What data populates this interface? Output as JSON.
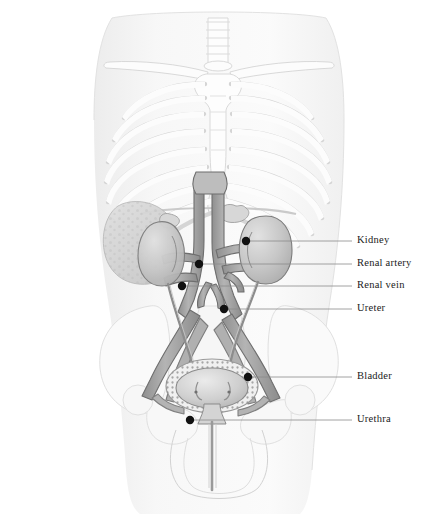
{
  "figure": {
    "style": "grayscale medical line drawing on white background",
    "view": "anterior (front) view of human torso"
  },
  "colors": {
    "background": "#ffffff",
    "body_silhouette": "#f2f2f2",
    "bone": "#fbfbfb",
    "bone_outline": "#d8d8d8",
    "vessel_fill": "#a8a8a8",
    "vessel_outline": "#6e6e6e",
    "kidney_fill": "#c9c9c9",
    "kidney_outline": "#7a7a7a",
    "bladder_fill": "#d2d2d2",
    "organ_shadow": "#bdbdbd",
    "leader_line": "#8a8a8a",
    "marker_dot": "#111111",
    "label_text": "#1a1a1a"
  },
  "labels": [
    {
      "id": "kidney",
      "text": "Kidney",
      "text_x": 357,
      "text_y": 243,
      "line_x1": 250,
      "line_y1": 241,
      "line_x2": 352,
      "line_y2": 241,
      "dot_x": 246,
      "dot_y": 241
    },
    {
      "id": "renal-artery",
      "text": "Renal artery",
      "text_x": 357,
      "text_y": 266,
      "line_x1": 203,
      "line_y1": 264,
      "line_x2": 352,
      "line_y2": 264,
      "dot_x": 199,
      "dot_y": 264
    },
    {
      "id": "renal-vein",
      "text": "Renal vein",
      "text_x": 357,
      "text_y": 288,
      "line_x1": 186,
      "line_y1": 286,
      "line_x2": 352,
      "line_y2": 286,
      "dot_x": 182,
      "dot_y": 286
    },
    {
      "id": "ureter",
      "text": "Ureter",
      "text_x": 357,
      "text_y": 311,
      "line_x1": 228,
      "line_y1": 309,
      "line_x2": 352,
      "line_y2": 309,
      "dot_x": 224,
      "dot_y": 309
    },
    {
      "id": "bladder",
      "text": "Bladder",
      "text_x": 357,
      "text_y": 379,
      "line_x1": 252,
      "line_y1": 377,
      "line_x2": 352,
      "line_y2": 377,
      "dot_x": 248,
      "dot_y": 377
    },
    {
      "id": "urethra",
      "text": "Urethra",
      "text_x": 357,
      "text_y": 422,
      "line_x1": 194,
      "line_y1": 420,
      "line_x2": 352,
      "line_y2": 420,
      "dot_x": 190,
      "dot_y": 420
    }
  ],
  "structures": [
    {
      "name": "trachea",
      "visible": true
    },
    {
      "name": "clavicle",
      "visible": true,
      "count": 2
    },
    {
      "name": "sternum",
      "visible": true
    },
    {
      "name": "rib-cage",
      "visible": true,
      "rib_pairs": 9
    },
    {
      "name": "xiphoid",
      "visible": true
    },
    {
      "name": "liver",
      "visible": true,
      "side": "left-of-image"
    },
    {
      "name": "kidney",
      "visible": true,
      "count": 2
    },
    {
      "name": "adrenal-gland",
      "visible": true,
      "count": 2
    },
    {
      "name": "aorta",
      "visible": true
    },
    {
      "name": "vena-cava",
      "visible": true
    },
    {
      "name": "renal-artery",
      "visible": true,
      "count": 2
    },
    {
      "name": "renal-vein",
      "visible": true,
      "count": 2
    },
    {
      "name": "iliac-vessels",
      "visible": true
    },
    {
      "name": "ureter",
      "visible": true,
      "count": 2
    },
    {
      "name": "bladder",
      "visible": true
    },
    {
      "name": "urethra",
      "visible": true
    },
    {
      "name": "pelvis",
      "visible": true
    },
    {
      "name": "sacrum",
      "visible": true
    },
    {
      "name": "femur-head",
      "visible": true,
      "count": 2
    }
  ]
}
